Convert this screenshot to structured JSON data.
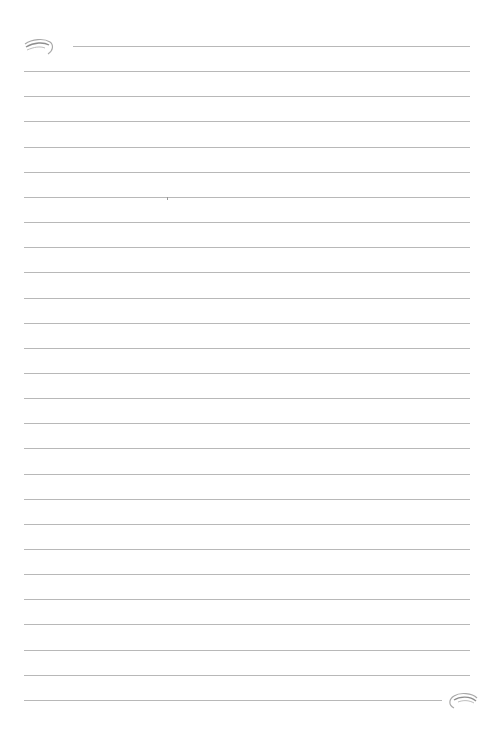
{
  "page": {
    "type": "lined-paper",
    "background": "#ffffff",
    "rule_color": "#b8b8b8",
    "line_count": 27,
    "first_line_y": 46,
    "line_spacing": 25.15,
    "left_x": 24,
    "right_x": 470,
    "first_line_left_x": 73,
    "last_line_right_x": 442
  },
  "ornaments": [
    {
      "name": "top-left-swirl",
      "position": "top-left"
    },
    {
      "name": "bottom-right-swirl",
      "position": "bottom-right"
    }
  ]
}
